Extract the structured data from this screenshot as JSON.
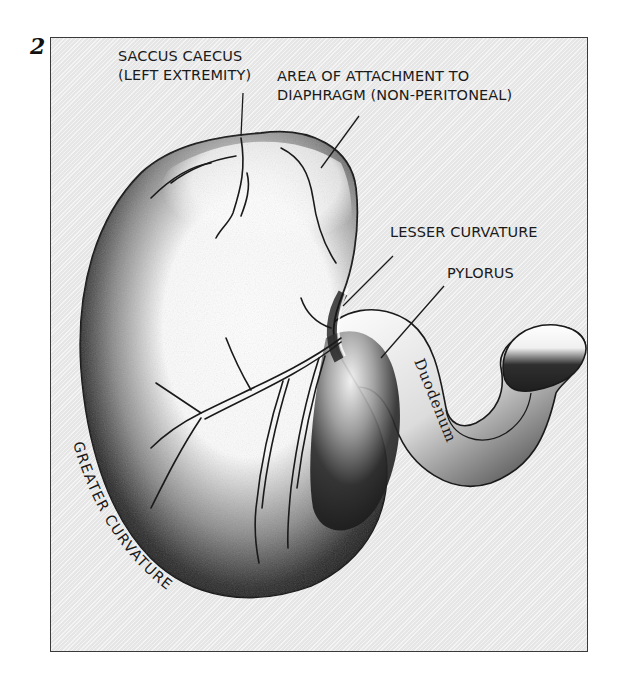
{
  "figure": {
    "number": "2",
    "colors": {
      "frame_background": "#e6e6e6",
      "frame_border": "#3a3a3a",
      "ink": "#1a1a1a",
      "organ_light": "#ffffff",
      "organ_shadow": "#1e1e1e"
    },
    "labels": {
      "saccus_caecus_line1": "SACCUS CAECUS",
      "saccus_caecus_line2": "(LEFT EXTREMITY)",
      "attachment_line1": "AREA OF ATTACHMENT TO",
      "attachment_line2": "DIAPHRAGM (NON-PERITONEAL)",
      "lesser_curvature": "LESSER CURVATURE",
      "pylorus": "PYLORUS",
      "duodenum": "Duodenum",
      "greater_curvature": "GREATER CURVATURE"
    }
  }
}
